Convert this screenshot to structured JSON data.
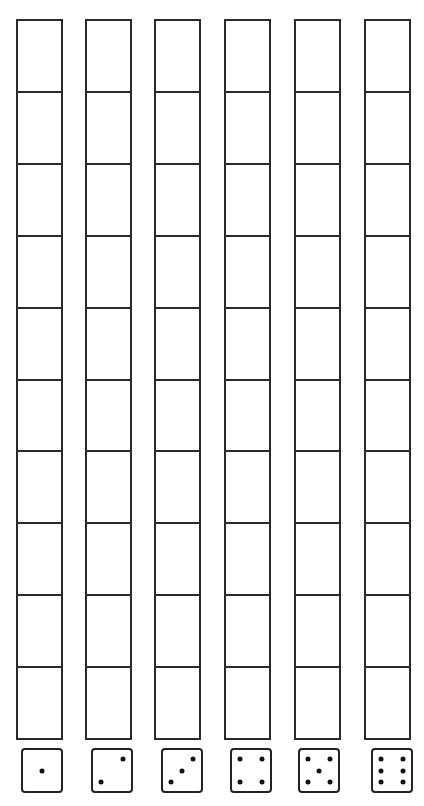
{
  "worksheet": {
    "rows_per_column": 10,
    "line_color": "#2a2a2a",
    "columns": [
      {
        "die_value": "1",
        "pips": [
          [
            50,
            50
          ]
        ]
      },
      {
        "die_value": "2",
        "pips": [
          [
            22,
            78
          ],
          [
            78,
            22
          ]
        ]
      },
      {
        "die_value": "3",
        "pips": [
          [
            22,
            78
          ],
          [
            50,
            50
          ],
          [
            78,
            22
          ]
        ]
      },
      {
        "die_value": "4",
        "pips": [
          [
            22,
            22
          ],
          [
            78,
            22
          ],
          [
            22,
            78
          ],
          [
            78,
            78
          ]
        ]
      },
      {
        "die_value": "5",
        "pips": [
          [
            22,
            22
          ],
          [
            78,
            22
          ],
          [
            50,
            50
          ],
          [
            22,
            78
          ],
          [
            78,
            78
          ]
        ]
      },
      {
        "die_value": "6",
        "pips": [
          [
            22,
            22
          ],
          [
            78,
            22
          ],
          [
            22,
            50
          ],
          [
            78,
            50
          ],
          [
            22,
            78
          ],
          [
            78,
            78
          ]
        ]
      }
    ]
  }
}
